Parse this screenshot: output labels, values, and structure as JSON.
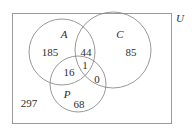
{
  "diagram": {
    "type": "venn-3-set",
    "universe": {
      "label": "U",
      "outside_count": "297"
    },
    "sets": [
      {
        "key": "A",
        "label": "A",
        "only_count": "185"
      },
      {
        "key": "C",
        "label": "C",
        "only_count": "85"
      },
      {
        "key": "P",
        "label": "P",
        "only_count": "68"
      }
    ],
    "regions": {
      "a_only": "185",
      "c_only": "85",
      "p_only": "68",
      "a_and_c": "44",
      "a_and_p": "16",
      "c_and_p": "0",
      "a_and_c_and_p": "1",
      "outside": "297"
    },
    "colors": {
      "stroke": "#8c8c8c",
      "border": "#9a9a9a",
      "text": "#2e2e2e",
      "background": "#ffffff"
    }
  }
}
